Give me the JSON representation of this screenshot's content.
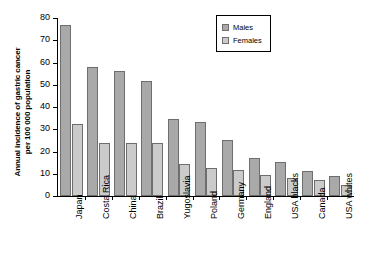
{
  "chart_data": {
    "type": "bar",
    "title": "",
    "xlabel": "",
    "ylabel": "Annual incidence of gastric cancer\nper 100 000 population",
    "ylim": [
      0,
      80
    ],
    "yticks": [
      0,
      10,
      20,
      30,
      40,
      50,
      60,
      70,
      80
    ],
    "grid": false,
    "legend_position": "top-right",
    "categories": [
      "Japan",
      "Costa Rica",
      "China",
      "Brazil",
      "Yugoslavia",
      "Poland",
      "Germany",
      "England",
      "USA blacks",
      "Canada",
      "USA whites"
    ],
    "series": [
      {
        "name": "Males",
        "color": "#a9a9a9",
        "values": [
          77.0,
          58.0,
          56.0,
          51.8,
          34.5,
          33.2,
          25.2,
          17.3,
          15.3,
          11.2,
          9.2
        ]
      },
      {
        "name": "Females",
        "color": "#cbcbcb",
        "values": [
          32.5,
          24.0,
          23.7,
          23.8,
          14.3,
          12.5,
          11.5,
          9.3,
          8.1,
          7.3,
          4.8
        ]
      }
    ]
  },
  "legend": {
    "items": [
      {
        "label": "Males",
        "swatch": "male"
      },
      {
        "label": "Females",
        "swatch": "female"
      }
    ]
  }
}
